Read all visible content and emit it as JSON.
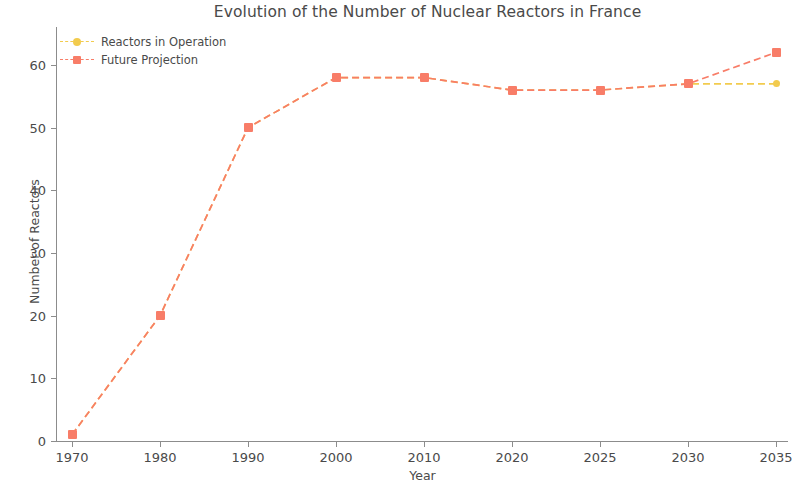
{
  "chart_data": {
    "type": "line",
    "title": "Evolution of the Number of Nuclear Reactors in France",
    "xlabel": "Year",
    "ylabel": "Number of Reactors",
    "categories": [
      "1970",
      "1980",
      "1990",
      "2000",
      "2010",
      "2020",
      "2025",
      "2030",
      "2035"
    ],
    "xticklabels": [
      "1970",
      "1980",
      "1990",
      "2000",
      "2010",
      "2020",
      "2025",
      "2030",
      "2035"
    ],
    "yticklabels": [
      "0",
      "10",
      "20",
      "30",
      "40",
      "50",
      "60"
    ],
    "ytickvalues": [
      0,
      10,
      20,
      30,
      40,
      50,
      60
    ],
    "ylim": [
      -2,
      65
    ],
    "xlim": [
      -0.35,
      8.45
    ],
    "grid": false,
    "legend_position": "upper left",
    "series": [
      {
        "name": "Reactors in Operation",
        "color": "#f2cb4e",
        "linestyle": "dashed",
        "marker": "circle",
        "x": [
          "1970",
          "1980",
          "1990",
          "2000",
          "2010",
          "2020",
          "2025",
          "2030",
          "2035"
        ],
        "values": [
          1,
          20,
          50,
          58,
          58,
          56,
          56,
          57,
          57
        ]
      },
      {
        "name": "Future Projection",
        "color": "#f87d68",
        "linestyle": "dashed",
        "marker": "square",
        "x": [
          "1970",
          "1980",
          "1990",
          "2000",
          "2010",
          "2020",
          "2025",
          "2030",
          "2035"
        ],
        "values": [
          1,
          20,
          50,
          58,
          58,
          56,
          56,
          57,
          62
        ]
      }
    ]
  },
  "legend": {
    "entries": [
      {
        "label": "Reactors in Operation",
        "color": "#f2cb4e",
        "marker": "circle"
      },
      {
        "label": "Future Projection",
        "color": "#f87d68",
        "marker": "square"
      }
    ]
  },
  "colors": {
    "operation": "#f2cb4e",
    "projection": "#f87d68",
    "axis": "#8c8c8c",
    "text": "#4a4a4a",
    "background": "#ffffff"
  }
}
